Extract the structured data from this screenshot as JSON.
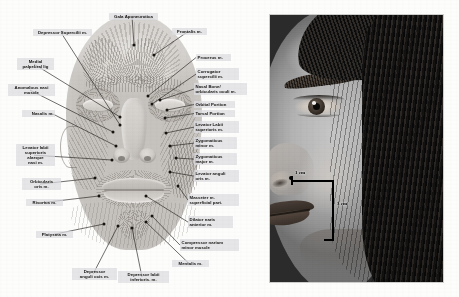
{
  "figure": {
    "type": "two-panel anatomical figure",
    "left_panel_caption": "Facial mimetic musculature, anterior view",
    "right_panel_caption": "Clinical photograph, right hemiface, profile-oblique"
  },
  "anatomy": {
    "labels": [
      {
        "id": "galea-aponeurotica",
        "text": "Gala Aponeurotica",
        "x": 109,
        "y": 13,
        "w": 46,
        "align": "ctr",
        "chip": true,
        "dot": [
          134,
          45
        ]
      },
      {
        "id": "depressor-supercilii",
        "text": "Depressor Supercilii m.",
        "x": 33,
        "y": 29,
        "w": 56,
        "align": "ctr",
        "chip": true,
        "dot": [
          120,
          125
        ]
      },
      {
        "id": "frontalis",
        "text": "Frontalis m.",
        "x": 172,
        "y": 28,
        "w": 32,
        "align": "ctr",
        "chip": true,
        "dot": [
          154,
          55
        ]
      },
      {
        "id": "procerus",
        "text": "Procerus m.",
        "x": 196,
        "y": 54,
        "w": 32,
        "align": "rt",
        "chip": true,
        "dot": [
          148,
          96
        ]
      },
      {
        "id": "medial-palpebral-lig",
        "text": "Medial\npalpebral lig",
        "x": 17,
        "y": 58,
        "w": 34,
        "align": "ctr",
        "chip": true,
        "dot": [
          120,
          117
        ]
      },
      {
        "id": "corrugator-supercilii",
        "text": "Corrugator\nsupercilii m.",
        "x": 196,
        "y": 68,
        "w": 40,
        "align": "rt",
        "chip": true,
        "dot": [
          152,
          104
        ]
      },
      {
        "id": "anomalous-nasi",
        "text": "Anomalous nasi\nmuscle",
        "x": 8,
        "y": 84,
        "w": 44,
        "align": "ctr",
        "chip": true,
        "dot": [
          113,
          132
        ]
      },
      {
        "id": "nasal-bone-orbicularis",
        "text": "Nasal Bone/\norbicularis oculi m.",
        "x": 194,
        "y": 83,
        "w": 50,
        "align": "rt",
        "chip": true,
        "dot": [
          160,
          100
        ]
      },
      {
        "id": "orbital-portion",
        "text": "Orbital Portion",
        "x": 194,
        "y": 101,
        "w": 38,
        "align": "rt",
        "chip": true,
        "dot": [
          167,
          110
        ]
      },
      {
        "id": "tarsal-portion",
        "text": "Tarsal Portion",
        "x": 194,
        "y": 110,
        "w": 38,
        "align": "rt",
        "chip": true,
        "dot": [
          165,
          118
        ]
      },
      {
        "id": "nasalis",
        "text": "Nasalis m.",
        "x": 22,
        "y": 110,
        "w": 30,
        "align": "lt",
        "chip": true,
        "dot": [
          116,
          146
        ]
      },
      {
        "id": "levator-labii-sup",
        "text": "Levator Labii\nsuperioris m.",
        "x": 194,
        "y": 121,
        "w": 42,
        "align": "rt",
        "chip": true,
        "dot": [
          166,
          133
        ]
      },
      {
        "id": "zygomaticus-minor",
        "text": "Zygomaticus\nminor m.",
        "x": 194,
        "y": 137,
        "w": 40,
        "align": "rt",
        "chip": true,
        "dot": [
          170,
          146
        ]
      },
      {
        "id": "levator-labii-alaeque",
        "text": "Levator labii\nsuperioris\nalaeque\nnasi m.",
        "x": 16,
        "y": 144,
        "w": 36,
        "align": "ctr",
        "chip": true,
        "dot": [
          112,
          160
        ]
      },
      {
        "id": "zygomaticus-major",
        "text": "Zygomaticus\nmajor m.",
        "x": 194,
        "y": 153,
        "w": 40,
        "align": "rt",
        "chip": true,
        "dot": [
          176,
          158
        ]
      },
      {
        "id": "levator-anguli-oris",
        "text": "Levator anguli\noris m.",
        "x": 194,
        "y": 170,
        "w": 42,
        "align": "rt",
        "chip": true,
        "dot": [
          170,
          172
        ]
      },
      {
        "id": "orbicularis-oris",
        "text": "Orbicularis\noris m.",
        "x": 22,
        "y": 178,
        "w": 36,
        "align": "ctr",
        "chip": true,
        "dot": [
          95,
          178
        ]
      },
      {
        "id": "masseter-superficial",
        "text": "Masseter m.\nsuperficial part.",
        "x": 188,
        "y": 194,
        "w": 48,
        "align": "rt",
        "chip": true,
        "dot": [
          178,
          186
        ]
      },
      {
        "id": "risorius",
        "text": "Risorius m.",
        "x": 26,
        "y": 199,
        "w": 34,
        "align": "ctr",
        "chip": true,
        "dot": [
          99,
          196
        ]
      },
      {
        "id": "dilator-naris-anterior",
        "text": "Dilator naris\nanterior m.",
        "x": 188,
        "y": 216,
        "w": 42,
        "align": "rt",
        "chip": true,
        "dot": [
          146,
          196
        ]
      },
      {
        "id": "platysma",
        "text": "Platysma m.",
        "x": 36,
        "y": 231,
        "w": 34,
        "align": "ctr",
        "chip": true,
        "dot": [
          104,
          224
        ]
      },
      {
        "id": "compressor-narium",
        "text": "Compressor narium\nminor muscle",
        "x": 180,
        "y": 239,
        "w": 56,
        "align": "rt",
        "chip": true,
        "dot": [
          152,
          216
        ]
      },
      {
        "id": "depressor-anguli-oris",
        "text": "Depressor\nanguli ocis m.",
        "x": 72,
        "y": 268,
        "w": 42,
        "align": "ctr",
        "chip": true,
        "dot": [
          118,
          226
        ]
      },
      {
        "id": "depressor-labii-inf",
        "text": "Depressor labii\ninferioris. m.",
        "x": 118,
        "y": 271,
        "w": 48,
        "align": "ctr",
        "chip": true,
        "dot": [
          132,
          228
        ]
      },
      {
        "id": "mentalis",
        "text": "Mentalis m.",
        "x": 172,
        "y": 260,
        "w": 34,
        "align": "ctr",
        "chip": true,
        "dot": [
          146,
          222
        ]
      }
    ]
  },
  "photo": {
    "subject": "female face, right side, oblique view",
    "measurements": [
      {
        "id": "horizontal",
        "label": "1 cm",
        "orientation": "horizontal",
        "value": 1,
        "unit": "cm"
      },
      {
        "id": "vertical",
        "label": "3 cm",
        "orientation": "vertical",
        "value": 3,
        "unit": "cm"
      }
    ]
  },
  "colors": {
    "background": "#fdfdfb",
    "label_chip": "#dddde2",
    "label_text": "#14120f",
    "leader_line": "#23211f",
    "annotation": "#000000"
  }
}
